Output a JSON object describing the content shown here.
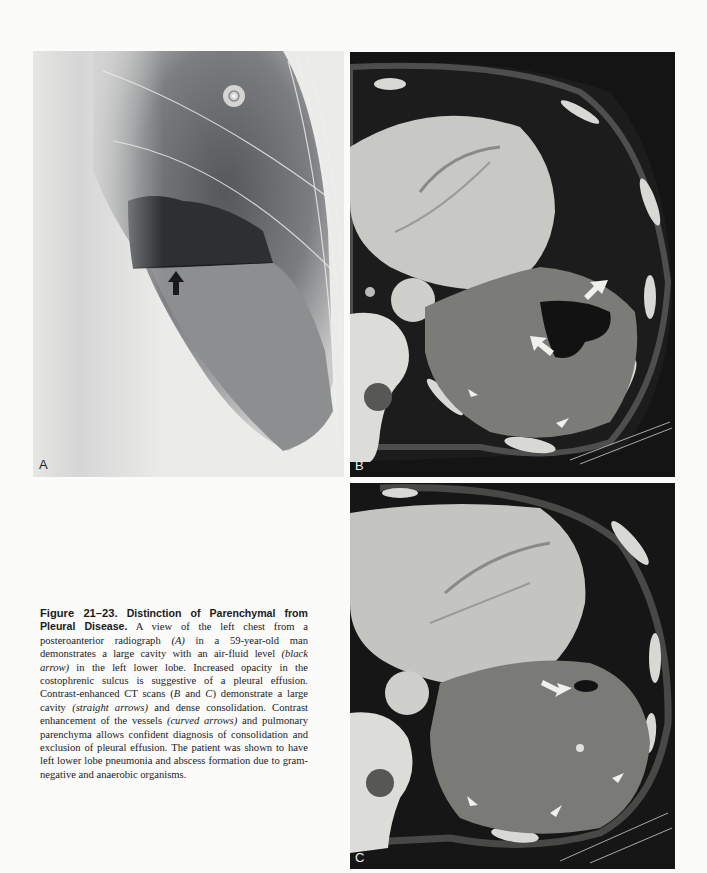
{
  "figure": {
    "number": "Figure 21–23.",
    "title": " Distinction of Parenchymal from Pleural Disease.",
    "panels": [
      {
        "id": "A",
        "label": "A",
        "modality": "posteroanterior radiograph",
        "annotations": [
          "black-arrow"
        ]
      },
      {
        "id": "B",
        "label": "B",
        "modality": "contrast-enhanced CT scan",
        "annotations": [
          "straight-arrow",
          "straight-arrow",
          "curved-arrow",
          "curved-arrow"
        ]
      },
      {
        "id": "C",
        "label": "C",
        "modality": "contrast-enhanced CT scan",
        "annotations": [
          "straight-arrow",
          "curved-arrow",
          "curved-arrow",
          "curved-arrow"
        ]
      }
    ],
    "caption_parts": [
      " A view of the left chest from a posteroanterior radiograph ",
      "(A)",
      " in a 59-year-old man demonstrates a large cavity with an air-fluid level ",
      "(black arrow)",
      " in the left lower lobe. Increased opacity in the costophrenic sulcus is suggestive of a pleural effusion. Contrast-enhanced CT scans (",
      "B",
      " and ",
      "C",
      ") demonstrate a large cavity ",
      "(straight arrows)",
      " and dense consolidation. Contrast enhancement of the vessels ",
      "(curved arrows)",
      " and pulmonary parenchyma allows confident diagnosis of consolidation and exclusion of pleural effusion. The patient was shown to have left lower lobe pneumonia and abscess formation due to gram-negative and anaerobic organisms."
    ]
  }
}
